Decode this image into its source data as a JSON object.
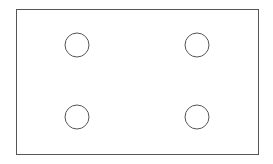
{
  "diagram": {
    "stroke_color": "#555555",
    "background": "#ffffff",
    "rectangle": {
      "x": 16,
      "y": 9,
      "width": 242,
      "height": 145
    },
    "circles": [
      {
        "cx": 77,
        "cy": 45,
        "r": 12
      },
      {
        "cx": 197,
        "cy": 45,
        "r": 12
      },
      {
        "cx": 77,
        "cy": 117,
        "r": 12
      },
      {
        "cx": 197,
        "cy": 117,
        "r": 12
      }
    ]
  }
}
